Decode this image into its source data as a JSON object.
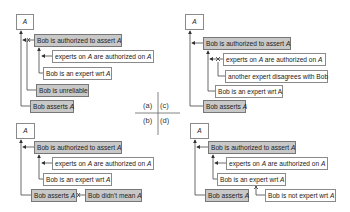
{
  "panels": {
    "a": {
      "label": "(a)",
      "claim": "A",
      "nodes": [
        {
          "text": "Bob is authorized to assert ",
          "var": "A",
          "fill": "gray"
        },
        {
          "text": "experts on ",
          "var": "A",
          "mid": " are authorized on ",
          "var2": "A",
          "fill": "white"
        },
        {
          "text": "Bob is an expert wrt ",
          "var": "A",
          "fill": "white"
        },
        {
          "text": "Bob is unreliable",
          "fill": "gray"
        },
        {
          "text": "Bob asserts ",
          "var": "A",
          "fill": "gray"
        }
      ]
    },
    "c": {
      "label": "(c)",
      "claim": "A",
      "nodes": [
        {
          "text": "Bob is authorized to assert ",
          "var": "A",
          "fill": "gray"
        },
        {
          "text": "experts on ",
          "var": "A",
          "mid": " are authorized on ",
          "var2": "A",
          "fill": "white"
        },
        {
          "text": "another expert disagrees with Bob",
          "fill": "white"
        },
        {
          "text": "Bob is an expert wrt A",
          "fill": "white"
        },
        {
          "text": "Bob asserts ",
          "var": "A",
          "fill": "gray"
        }
      ]
    },
    "b": {
      "label": "(b)",
      "claim": "A",
      "nodes": [
        {
          "text": "Bob is authorized to assert ",
          "var": "A",
          "fill": "gray"
        },
        {
          "text": "experts on ",
          "var": "A",
          "mid": " are authorized on ",
          "var2": "A",
          "fill": "white"
        },
        {
          "text": "Bob is an expert wrt ",
          "var": "A",
          "fill": "white"
        },
        {
          "text": "Bob asserts ",
          "var": "A",
          "fill": "gray"
        },
        {
          "text": "Bob didn't mean ",
          "var": "A",
          "fill": "gray"
        }
      ]
    },
    "d": {
      "label": "(d)",
      "claim": "A",
      "nodes": [
        {
          "text": "Bob is authorized to assert ",
          "var": "A",
          "fill": "gray"
        },
        {
          "text": "experts on ",
          "var": "A",
          "mid": " are authorized on ",
          "var2": "A",
          "fill": "white"
        },
        {
          "text": "Bob is an expert wrt ",
          "var": "A",
          "fill": "white"
        },
        {
          "text": "Bob asserts ",
          "var": "A",
          "fill": "gray"
        },
        {
          "text": "Bob is not expert wrt ",
          "var": "A",
          "fill": "white"
        }
      ]
    }
  },
  "colors": {
    "gray_fill": "#c8c8c8",
    "white_fill": "#ffffff",
    "border": "#8a8a8a",
    "line": "#333333"
  }
}
